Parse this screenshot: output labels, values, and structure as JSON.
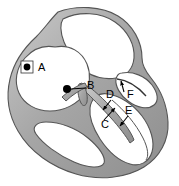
{
  "figure": {
    "width": 179,
    "height": 186,
    "background_color": "#ffffff",
    "wall_fill_color": "#a8a8a8",
    "wall_outline_color": "#4d4d4d",
    "chamber_fill_color": "#ffffff",
    "marker_color": "#000000",
    "label_color": "#000000"
  },
  "labels": [
    {
      "id": "A",
      "text": "A",
      "pointer_type": "dot",
      "text_x": 40,
      "text_y": 68,
      "marker_x": 27,
      "marker_y": 67
    },
    {
      "id": "B",
      "text": "B",
      "pointer_type": "dot-with-leader-line",
      "text_x": 90,
      "text_y": 86,
      "marker_x": 67,
      "marker_y": 89
    },
    {
      "id": "C",
      "text": "C",
      "pointer_type": "arrow",
      "text_x": 106,
      "text_y": 123,
      "arrow_tip_x": 113,
      "arrow_tip_y": 109
    },
    {
      "id": "D",
      "text": "D",
      "pointer_type": "arrow",
      "text_x": 110,
      "text_y": 95,
      "arrow_tip_x": 104,
      "arrow_tip_y": 106
    },
    {
      "id": "E",
      "text": "E",
      "pointer_type": "arrow",
      "text_x": 128,
      "text_y": 111,
      "arrow_tip_x": 122,
      "arrow_tip_y": 120
    },
    {
      "id": "F",
      "text": "F",
      "pointer_type": "arrow",
      "text_x": 126,
      "text_y": 95,
      "arrow_tip_x": 122,
      "arrow_tip_y": 84
    }
  ]
}
